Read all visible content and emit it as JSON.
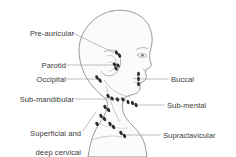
{
  "figure": {
    "view": "right lateral profile of head and neck",
    "colors": {
      "outline": "#6f6f6f",
      "fill": "#fbfbfb",
      "node": "#2b2b2b",
      "leader": "#9a9a9a",
      "text": "#3a3a3a",
      "background": "#ffffff"
    }
  },
  "labels": {
    "left": [
      {
        "id": "pre-auricular",
        "text": "Pre-auricular",
        "lines": [
          "Pre-auricular"
        ],
        "x": 14,
        "y": 29
      },
      {
        "id": "parotid",
        "text": "Parotid",
        "lines": [
          "Parotid"
        ],
        "x": 38,
        "y": 61
      },
      {
        "id": "occipital",
        "text": "Occipital",
        "lines": [
          "Occipital"
        ],
        "x": 32,
        "y": 75
      },
      {
        "id": "sub-mandibular",
        "text": "Sub-mandibular",
        "lines": [
          "Sub-mandibular"
        ],
        "x": 5,
        "y": 95
      },
      {
        "id": "superficial-and-deep-cervical",
        "text": "Superficial and deep cervical",
        "lines": [
          "Superficial and",
          "deep cervical"
        ],
        "x": 12,
        "y": 120
      }
    ],
    "right": [
      {
        "id": "buccal",
        "text": "Buccal",
        "lines": [
          "Buccal"
        ],
        "x": 172,
        "y": 75
      },
      {
        "id": "sub-mental",
        "text": "Sub-mental",
        "lines": [
          "Sub-mental"
        ],
        "x": 168,
        "y": 101
      },
      {
        "id": "supraclavicular",
        "text": "Supraclavicular",
        "lines": [
          "Supraclavicular"
        ],
        "x": 164,
        "y": 131
      }
    ]
  },
  "node_groups": [
    {
      "id": "pre-auricular",
      "count": 2
    },
    {
      "id": "parotid",
      "count": 3
    },
    {
      "id": "occipital",
      "count": 2
    },
    {
      "id": "buccal",
      "count": 3
    },
    {
      "id": "sub-mandibular",
      "count": 4
    },
    {
      "id": "sub-mental",
      "count": 3
    },
    {
      "id": "superficial-and-deep-cervical",
      "count": 7
    },
    {
      "id": "supraclavicular",
      "count": 2
    }
  ]
}
